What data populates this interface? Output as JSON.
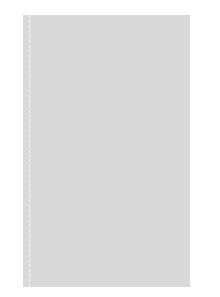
{
  "chart_data": {
    "type": "table",
    "title": "",
    "rows": 36,
    "columns": 23,
    "left_labels": [
      "36",
      "34",
      "32",
      "30",
      "28",
      "26",
      "24",
      "22",
      "20",
      "18",
      "16",
      "14",
      "12",
      "10",
      "8",
      "6",
      "4",
      "2"
    ],
    "right_labels": [
      "35",
      "33",
      "31",
      "29",
      "27",
      "25",
      "23",
      "21",
      "19",
      "17",
      "15",
      "13",
      "11",
      "9",
      "7",
      "5",
      "3",
      "1"
    ],
    "legend": {
      "d": "dark",
      "g": "light gray",
      "w": "white"
    },
    "colors": {
      "d": "#3a3a3a",
      "g": "#a9a9a9",
      "w": "#ffffff",
      "grid": "#d9d9d9"
    },
    "grid": [
      "ddddddddddddddddddddddd",
      "ddddddddddddddddddddddd",
      "ddddddddddddddddddddddd",
      "dgggddgggdddgggddgggddd",
      "dggdgggdgggdgggdggdgggd",
      "gdgggdgggdgggdgggdggggd",
      "gddgddddddddddgddddgddg",
      "dwdddwwwddddwwwdddwwddd",
      "wwdddwwwwddwwwwdddwwwdw",
      "ddwdddwwddddwwdddwdddwd",
      "dddwdddwddwddwdddwdddwd",
      "ggggggggggggggggggggggg",
      "ggggggggggggggggggggggg",
      "ggggggggggggggggggggggg",
      "dddwwddwwdddwwddwwdddww",
      "dddwdddwwdddwddddwdddww",
      "wddddwwdddwwwdddwwdddww",
      "dwdddwwwwdwwwwwddwwdddw",
      "gddgdddddddddddddddgddg",
      "ggdgdgddddddddddgdgdggd",
      "gggdgggdddgggdgdgggdggd",
      "dggdggdgdggdggdggdgdggd",
      "dddggdgggggdggggggddggd",
      "ddddddddddddddddddddddd",
      "ddddddddddddddddddddddd",
      "dggdddgdddggdddgddddggd",
      "ggddgdggdddggddgdggdgdd",
      "gddggddddggdgdddddggddg",
      "ddwwddwdddwwwddwwddwwdd",
      "dwwwwdwdddddwwwwwddwwwd",
      "wdddwwwdddddwwdwwddwdww",
      "ddggggddddddddgggdggdgd",
      "gdddggdgddddddggdgddggg",
      "ggdggggddgdddgdgggdgggd",
      "gggdgggddddddddgggddggd",
      "dgggdddgggdgddgggdgggdd"
    ]
  }
}
